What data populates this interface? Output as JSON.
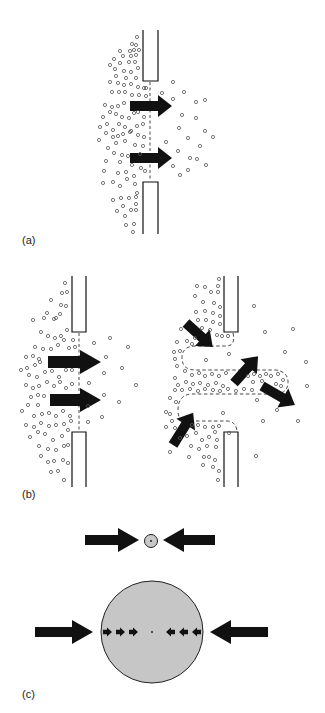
{
  "figure": {
    "panels": [
      {
        "id": "a",
        "label": "(a)"
      },
      {
        "id": "b",
        "label": "(b)"
      },
      {
        "id": "c",
        "label": "(c)"
      }
    ],
    "colors": {
      "background": "#ffffff",
      "ink": "#111111",
      "particle": "#555555",
      "droplet_fill": "#c8c8c8",
      "dashed": "#333333"
    }
  }
}
